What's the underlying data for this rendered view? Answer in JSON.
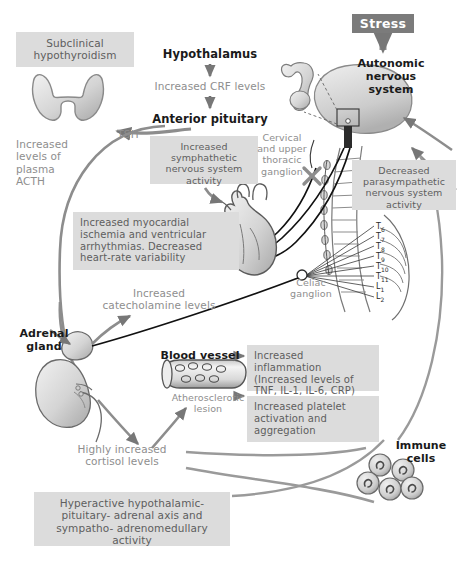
{
  "diagram": {
    "type": "physiology-flow-diagram",
    "nodes": {
      "stress": "Stress",
      "autonomic_nervous_system": "Autonomic\nnervous\nsystem",
      "hypothalamus": "Hypothalamus",
      "increased_crf": "Increased CRF levels",
      "anterior_pituitary": "Anterior pituitary",
      "tsh": "TSH",
      "subclinical_hypothyroidism": "Subclinical\nhypothyroidism",
      "plasma_acth": "Increased\nlevels of\nplasma\nACTH",
      "increased_sympathetic": "Increased\nsymphathetic\nnervous system\nactivity",
      "cervical_ganglion": "Cervical\nand upper\nthoracic\nganglion",
      "decreased_parasympathetic": "Decreased\nparasympathetic\nnervous system\nactivity",
      "myocardial": "Increased myocardial\nischemia and ventricular\narrhythmias. Decreased\nheart-rate variability",
      "celiac_ganglion": "Celiac\nganglion",
      "catecholamine": "Increased\ncatecholamine levels",
      "adrenal_gland": "Adrenal\ngland",
      "blood_vessel": "Blood vessel",
      "atherosclerotic_lesion": "Atherosclerotic\nlesion",
      "inflammation": "Increased inflammation\n(Increased levels of\nTNF, IL-1, IL-6, CRP)",
      "platelet": "Increased platelet\nactivation and\naggregation",
      "cortisol": "Highly increased\ncortisol levels",
      "immune_cells": "Immune\ncells",
      "hpa_axis": "Hyperactive\nhypothalamic-pituitary-\nadrenal axis and sympatho-\nadrenomedullary activity"
    },
    "spinal_levels": [
      {
        "letter": "T",
        "number": "6"
      },
      {
        "letter": "T",
        "number": "7"
      },
      {
        "letter": "T",
        "number": "8"
      },
      {
        "letter": "T",
        "number": "9"
      },
      {
        "letter": "T",
        "number": "10"
      },
      {
        "letter": "T",
        "number": "11"
      },
      {
        "letter": "L",
        "number": "1"
      },
      {
        "letter": "L",
        "number": "2"
      }
    ],
    "colors": {
      "box_fill": "#dcdcdc",
      "box_text": "#5e5e5e",
      "stress_fill": "#7b7b7b",
      "stress_text": "#ffffff",
      "arrow_gray": "#9a9a9a",
      "arrow_dark": "#6f6f6f",
      "nerve_black": "#111111",
      "organ_fill": "#d0d0d0",
      "organ_stroke": "#6a6a6a",
      "background": "#ffffff"
    }
  }
}
